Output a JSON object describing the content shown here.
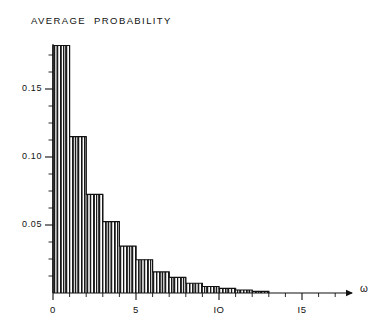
{
  "chart_data": {
    "type": "bar",
    "title": "AVERAGE  PROBABILITY",
    "xlabel": "ω",
    "ylabel": "",
    "xlim": [
      0,
      17.2
    ],
    "ylim": [
      0,
      0.19
    ],
    "grid": false,
    "legend": null,
    "bar_fill": "vertical-hatch",
    "bar_width": 0.25,
    "x_tick_labels": [
      "0",
      "5",
      "IO",
      "I5"
    ],
    "x_tick_values": [
      0,
      5,
      10,
      15
    ],
    "y_tick_labels": [
      "0.05",
      "0.10",
      "0.15"
    ],
    "y_tick_values": [
      0.05,
      0.1,
      0.15
    ],
    "x_minor_tick_step": 1,
    "y_minor_tick_step": 0.0125,
    "x": [
      0.125,
      0.375,
      0.625,
      0.875,
      1.125,
      1.375,
      1.625,
      1.875,
      2.125,
      2.375,
      2.625,
      2.875,
      3.125,
      3.375,
      3.625,
      3.875,
      4.125,
      4.375,
      4.625,
      4.875,
      5.125,
      5.375,
      5.625,
      5.875,
      6.125,
      6.375,
      6.625,
      6.875,
      7.125,
      7.375,
      7.625,
      7.875,
      8.125,
      8.375,
      8.625,
      8.875,
      9.125,
      9.375,
      9.625,
      9.875,
      10.125,
      10.375,
      10.625,
      10.875,
      11.125,
      11.375,
      11.625,
      11.875,
      12.125,
      12.375,
      12.625,
      12.875
    ],
    "values": [
      0.182,
      0.182,
      0.182,
      0.182,
      0.115,
      0.115,
      0.115,
      0.115,
      0.0725,
      0.0725,
      0.0725,
      0.0725,
      0.0525,
      0.0525,
      0.0525,
      0.0525,
      0.0345,
      0.0345,
      0.0345,
      0.0345,
      0.0245,
      0.0245,
      0.0245,
      0.0245,
      0.0155,
      0.0155,
      0.0155,
      0.0155,
      0.0115,
      0.0115,
      0.0115,
      0.0115,
      0.0072,
      0.0072,
      0.0072,
      0.0072,
      0.0048,
      0.0048,
      0.0048,
      0.0048,
      0.0034,
      0.0034,
      0.0034,
      0.0034,
      0.0022,
      0.0022,
      0.0022,
      0.0022,
      0.0012,
      0.0012,
      0.0012,
      0.0012
    ],
    "step_groups": [
      {
        "x_start": 0.0,
        "x_end": 1.0,
        "value": 0.182
      },
      {
        "x_start": 1.0,
        "x_end": 2.0,
        "value": 0.115
      },
      {
        "x_start": 2.0,
        "x_end": 3.0,
        "value": 0.0725
      },
      {
        "x_start": 3.0,
        "x_end": 4.0,
        "value": 0.0525
      },
      {
        "x_start": 4.0,
        "x_end": 5.0,
        "value": 0.0345
      },
      {
        "x_start": 5.0,
        "x_end": 6.0,
        "value": 0.0245
      },
      {
        "x_start": 6.0,
        "x_end": 7.0,
        "value": 0.0155
      },
      {
        "x_start": 7.0,
        "x_end": 8.0,
        "value": 0.0115
      },
      {
        "x_start": 8.0,
        "x_end": 9.0,
        "value": 0.0072
      },
      {
        "x_start": 9.0,
        "x_end": 10.0,
        "value": 0.0048
      },
      {
        "x_start": 10.0,
        "x_end": 11.0,
        "value": 0.0034
      },
      {
        "x_start": 11.0,
        "x_end": 12.0,
        "value": 0.0022
      },
      {
        "x_start": 12.0,
        "x_end": 13.0,
        "value": 0.0012
      }
    ],
    "colors": {
      "line": "#111111",
      "fill": "#222222",
      "background": "#ffffff"
    }
  }
}
